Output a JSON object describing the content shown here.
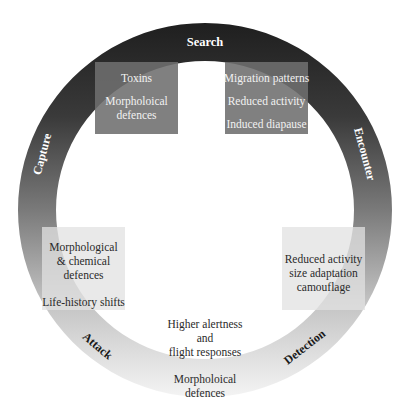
{
  "diagram": {
    "ring": {
      "center": [
        205,
        210
      ],
      "outer_radius": 187,
      "inner_radius": 149,
      "gradient_top": "#1f1f1f",
      "gradient_mid": "#7a7a7a",
      "gradient_bottom": "#f4f4f4"
    },
    "stages": {
      "search": "Search",
      "encounter": "Encounter",
      "detection": "Detection",
      "attack": "Attack",
      "capture": "Capture"
    },
    "boxes": {
      "top_left": {
        "lines": [
          "Toxins",
          "Morpholoical defences"
        ]
      },
      "top_right": {
        "lines": [
          "Migration patterns",
          "Reduced activity",
          "Induced diapause"
        ]
      },
      "mid_left": {
        "lines": [
          "Morphological & chemical defences",
          "Life-history shifts"
        ]
      },
      "mid_right": {
        "lines": [
          "Reduced activity",
          "size adaptation",
          "camouflage"
        ]
      }
    },
    "bottom_center": {
      "lines": [
        "Higher alertness",
        "and",
        "flight responses"
      ]
    },
    "bottom_ring": {
      "lines": [
        "Morpholoical",
        "defences"
      ]
    }
  }
}
